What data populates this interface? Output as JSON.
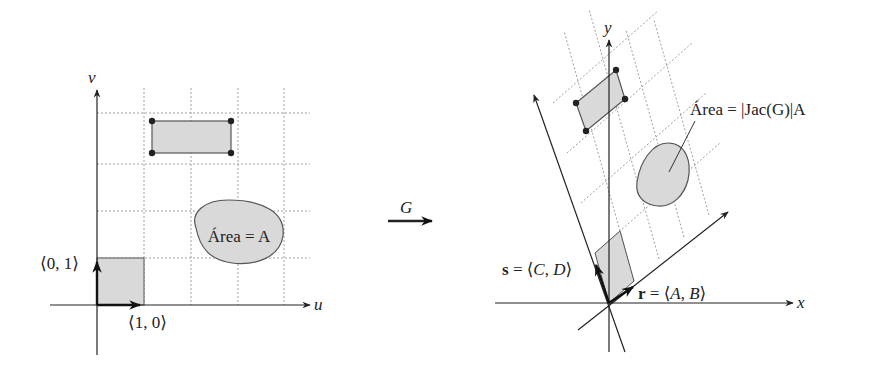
{
  "left_panel": {
    "axis_labels": {
      "horizontal": "u",
      "vertical": "v"
    },
    "vector_labels": {
      "e1": "⟨1, 0⟩",
      "e2": "⟨0, 1⟩"
    },
    "region_label": "Área = A",
    "colors": {
      "fill": "#d9d9d9",
      "stroke": "#555555",
      "grid": "#9a9a9a",
      "axis": "#222222"
    }
  },
  "map_arrow": {
    "label": "G"
  },
  "right_panel": {
    "axis_labels": {
      "horizontal": "x",
      "vertical": "y"
    },
    "vector_labels": {
      "r": "r = ⟨A, B⟩",
      "s": "s = ⟨C, D⟩"
    },
    "region_label": "Área = |Jac(G)|A",
    "colors": {
      "fill": "#d9d9d9",
      "stroke": "#555555",
      "grid": "#9a9a9a",
      "axis": "#222222"
    }
  }
}
